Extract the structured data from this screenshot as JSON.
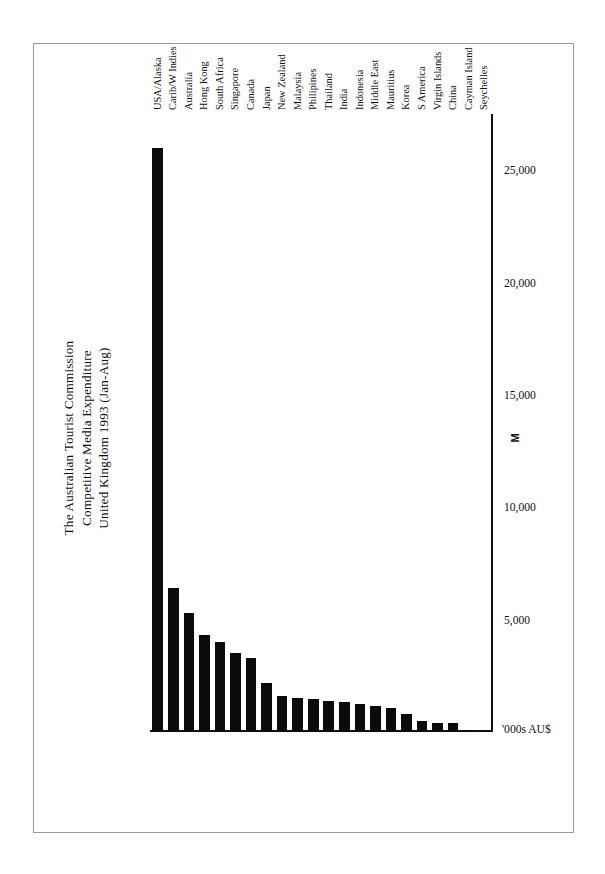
{
  "document": {
    "kind": "scanned-chart-page",
    "frame_visible": true
  },
  "chart_data": {
    "type": "bar",
    "orientation": "horizontal",
    "title": "The Australian Tourist Commission\nCompetitive Media Expenditure\nUnited Kingdom 1993 (Jan-Aug)",
    "title_lines": [
      "The Australian Tourist Commission",
      "Competitive Media Expenditure",
      "United Kingdom 1993 (Jan-Aug)"
    ],
    "xlabel": "'000s AU$",
    "ylabel": "",
    "unit_label": "'000s AU$",
    "footer_label": "M",
    "grid": false,
    "legend": false,
    "xlim": [
      0,
      27500
    ],
    "tick_labels": [
      "25,000",
      "20,000",
      "15,000",
      "10,000",
      "5,000"
    ],
    "tick_values": [
      25000,
      20000,
      15000,
      10000,
      5000
    ],
    "categories": [
      "USA/Alaska",
      "Carib/W Indies",
      "Australia",
      "Hong Kong",
      "South Africa",
      "Singapore",
      "Canada",
      "Japan",
      "New Zealand",
      "Malaysia",
      "Philipines",
      "Thailand",
      "India",
      "Indonesia",
      "Middle East",
      "Mauritius",
      "Korea",
      "S America",
      "Virgin Islands",
      "China",
      "Cayman Island",
      "Seychelles"
    ],
    "values": [
      26000,
      6400,
      5300,
      4300,
      4000,
      3500,
      3300,
      2200,
      1600,
      1500,
      1450,
      1400,
      1350,
      1250,
      1150,
      1050,
      800,
      500,
      420,
      380,
      90,
      60
    ]
  }
}
